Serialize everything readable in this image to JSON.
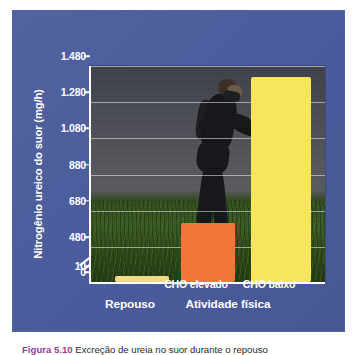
{
  "figure": {
    "caption_label": "Figura 5.10",
    "caption_text": "Excreção de ureia no suor durante o repouso"
  },
  "chart_data": {
    "type": "bar",
    "title": "",
    "xlabel": "",
    "ylabel": "Nitrogênio ureico do suor (mg/h)",
    "categories": [
      "Repouso",
      "CHO elevado",
      "CHO baixo"
    ],
    "values": [
      70,
      610,
      1420
    ],
    "ylim": [
      0,
      1480
    ],
    "yticks": [
      "1.480",
      "1.280",
      "1.080",
      "880",
      "680",
      "480",
      "10",
      "0"
    ],
    "ytick_values": [
      1480,
      1280,
      1080,
      880,
      680,
      480,
      10,
      0
    ],
    "axis_break": true,
    "axis_break_between": [
      480,
      10
    ],
    "grid": true,
    "legend": "none",
    "bar_colors": [
      "#f0d98a",
      "#f2763a",
      "#f7e65c"
    ],
    "background": "photograph of a runner",
    "groups": [
      {
        "label": "Repouso",
        "members": [
          "Repouso"
        ]
      },
      {
        "label": "Atividade física",
        "members": [
          "CHO elevado",
          "CHO baixo"
        ]
      }
    ]
  },
  "axis": {
    "y_title": "Nitrogênio ureico do suor (mg/h)",
    "ticks": [
      {
        "label": "1.480",
        "value": 1480
      },
      {
        "label": "1.280",
        "value": 1280
      },
      {
        "label": "1.080",
        "value": 1080
      },
      {
        "label": "880",
        "value": 880
      },
      {
        "label": "680",
        "value": 680
      },
      {
        "label": "480",
        "value": 480
      },
      {
        "label": "10",
        "value": 10
      },
      {
        "label": "0",
        "value": 0
      }
    ]
  },
  "bars": [
    {
      "name": "repouso",
      "label": "Repouso",
      "value": 70,
      "color": "#f0d98a"
    },
    {
      "name": "cho-elevado",
      "label": "CHO elevado",
      "value": 610,
      "color": "#f2763a"
    },
    {
      "name": "cho-baixo",
      "label": "CHO baixo",
      "value": 1420,
      "color": "#f7e65c"
    }
  ],
  "group_labels": [
    {
      "name": "repouso",
      "label": "Repouso"
    },
    {
      "name": "atividade-fisica",
      "label": "Atividade física"
    }
  ],
  "colors": {
    "panel_blue": "#4a5c9b",
    "bar_tan": "#f0d98a",
    "bar_orange": "#f2763a",
    "bar_yellow": "#f7e65c",
    "text_white": "#ffffff",
    "caption_accent": "#8e3f8e"
  }
}
